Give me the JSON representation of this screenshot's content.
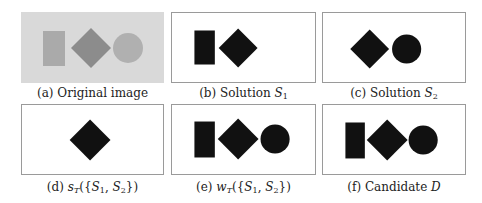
{
  "figure": {
    "panels": [
      {
        "id": "a",
        "label": "(a)",
        "caption_text": "Original image",
        "background": "#d9d9d9",
        "shapes": [
          {
            "type": "rectangle",
            "color": "#aaaaaa"
          },
          {
            "type": "diamond",
            "color": "#8c8c8c"
          },
          {
            "type": "circle",
            "color": "#b0b0b0"
          }
        ]
      },
      {
        "id": "b",
        "label": "(b)",
        "caption_text": "Solution",
        "caption_math": "S",
        "caption_sub": "1",
        "background": "#ffffff",
        "shapes": [
          {
            "type": "rectangle",
            "color": "#111111"
          },
          {
            "type": "diamond",
            "color": "#111111"
          }
        ]
      },
      {
        "id": "c",
        "label": "(c)",
        "caption_text": "Solution",
        "caption_math": "S",
        "caption_sub": "2",
        "background": "#ffffff",
        "shapes": [
          {
            "type": "diamond",
            "color": "#111111"
          },
          {
            "type": "circle",
            "color": "#111111"
          }
        ]
      },
      {
        "id": "d",
        "label": "(d)",
        "caption_math_full": "s_T({S_1, S_2})",
        "caption_fn": "s",
        "caption_fn_sub": "T",
        "caption_arg_open": "({",
        "caption_arg1": "S",
        "caption_arg1_sub": "1",
        "caption_sep": ", ",
        "caption_arg2": "S",
        "caption_arg2_sub": "2",
        "caption_arg_close": "})",
        "background": "#ffffff",
        "shapes": [
          {
            "type": "diamond",
            "color": "#111111"
          }
        ]
      },
      {
        "id": "e",
        "label": "(e)",
        "caption_math_full": "w_T({S_1, S_2})",
        "caption_fn": "w",
        "caption_fn_sub": "T",
        "caption_arg_open": "({",
        "caption_arg1": "S",
        "caption_arg1_sub": "1",
        "caption_sep": ", ",
        "caption_arg2": "S",
        "caption_arg2_sub": "2",
        "caption_arg_close": "})",
        "background": "#ffffff",
        "shapes": [
          {
            "type": "rectangle",
            "color": "#111111"
          },
          {
            "type": "diamond",
            "color": "#111111"
          },
          {
            "type": "circle",
            "color": "#111111"
          }
        ]
      },
      {
        "id": "f",
        "label": "(f)",
        "caption_text": "Candidate",
        "caption_math": "D",
        "background": "#ffffff",
        "shapes": [
          {
            "type": "rectangle",
            "color": "#111111"
          },
          {
            "type": "diamond",
            "color": "#111111"
          },
          {
            "type": "circle",
            "color": "#111111"
          }
        ]
      }
    ],
    "colors": {
      "border": "#9a9a9a",
      "shape_dark": "#111111",
      "orig_bg": "#d9d9d9",
      "orig_rect": "#aaaaaa",
      "orig_diamond": "#8c8c8c",
      "orig_circle": "#b0b0b0"
    }
  }
}
